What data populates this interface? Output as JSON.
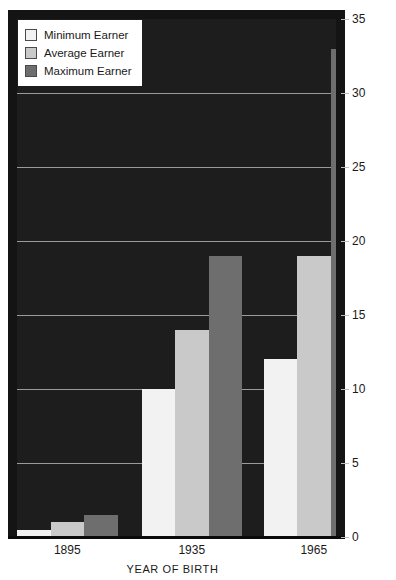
{
  "top_clipped_text": "",
  "chart_data": {
    "type": "bar",
    "title": "",
    "xlabel": "YEAR OF BIRTH",
    "ylabel": "",
    "categories": [
      "1895",
      "1935",
      "1965"
    ],
    "series": [
      {
        "name": "Minimum Earner",
        "color": "#f2f2f2",
        "values": [
          0.5,
          10,
          12
        ]
      },
      {
        "name": "Average Earner",
        "color": "#c9c9c9",
        "values": [
          1,
          14,
          19
        ]
      },
      {
        "name": "Maximum Earner",
        "color": "#6e6e6e",
        "values": [
          1.5,
          19,
          33
        ]
      }
    ],
    "ylim": [
      0,
      35
    ],
    "yticks": [
      0,
      5,
      10,
      15,
      20,
      25,
      30,
      35
    ],
    "ytick_labels": [
      "0",
      "5",
      "10",
      "15",
      "20",
      "25",
      "30",
      "35"
    ],
    "y_axis_position": "right",
    "grid": true,
    "legend_position": "top-left",
    "plot_background": "#1d1d1d"
  },
  "legend": {
    "items": [
      {
        "label": "Minimum Earner",
        "swatch": "#f2f2f2"
      },
      {
        "label": "Average Earner",
        "swatch": "#c9c9c9"
      },
      {
        "label": "Maximum Earner",
        "swatch": "#6e6e6e"
      }
    ]
  }
}
